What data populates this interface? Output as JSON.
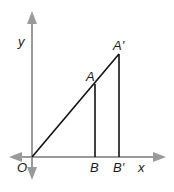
{
  "diagram": {
    "type": "coordinate-geometry",
    "axes": {
      "x_label": "x",
      "y_label": "y",
      "color": "#9a9a9a"
    },
    "points": {
      "origin": "O",
      "A": "A",
      "A_prime": "A'",
      "B": "B",
      "B_prime": "B'"
    },
    "segments": [
      {
        "from": "O",
        "to": "A'"
      },
      {
        "from": "A",
        "to": "B"
      },
      {
        "from": "A'",
        "to": "B'"
      }
    ],
    "line_color": "#111111"
  }
}
